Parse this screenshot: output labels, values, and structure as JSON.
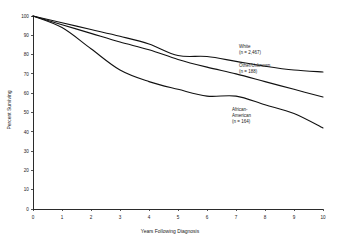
{
  "chart_data": {
    "type": "line",
    "title": "",
    "xlabel": "Years Following Diagnosis",
    "ylabel": "Percent Surviving",
    "xlim": [
      0,
      10
    ],
    "ylim": [
      0,
      100
    ],
    "grid": false,
    "legend_position": "inline-right",
    "xticks": [
      "0",
      "1",
      "2",
      "3",
      "4",
      "5",
      "6",
      "7",
      "8",
      "9",
      "10"
    ],
    "yticks": [
      "0",
      "10",
      "20",
      "30",
      "40",
      "50",
      "60",
      "70",
      "80",
      "90",
      "100"
    ],
    "x": [
      0,
      1,
      2,
      3,
      4,
      5,
      6,
      7,
      8,
      9,
      10
    ],
    "series": [
      {
        "name": "White",
        "count_label": "(n = 2,467)",
        "label_line1": "White",
        "label_line2": "(n = 2,467)",
        "color": "#111111",
        "values": [
          100,
          96.5,
          93,
          89.5,
          85.5,
          79.5,
          79,
          76.5,
          74,
          72,
          71
        ]
      },
      {
        "name": "Other/Unknown",
        "count_label": "(n = 188)",
        "label_line1": "Other/Unknown",
        "label_line2": "(n = 188)",
        "color": "#111111",
        "values": [
          100,
          95.5,
          91,
          86.5,
          82.5,
          77.5,
          73.5,
          70,
          66,
          62,
          58
        ]
      },
      {
        "name": "African-American",
        "count_label": "(n = 164)",
        "label_line1": "African-",
        "label_line2": "American",
        "label_line3": "(n = 164)",
        "color": "#111111",
        "values": [
          100,
          94,
          83,
          72,
          66,
          62,
          58.5,
          58.5,
          54,
          49.5,
          42
        ]
      }
    ]
  },
  "annotations": {
    "white": {
      "line1": "White",
      "line2": "(n = 2,467)"
    },
    "other": {
      "line1": "Other/Unknown",
      "line2": "(n = 188)"
    },
    "african_american": {
      "line1": "African-",
      "line2": "American",
      "line3": "(n = 164)"
    }
  }
}
